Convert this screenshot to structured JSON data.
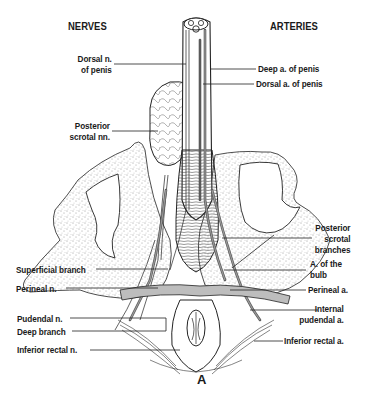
{
  "figure": {
    "panel_label": "A",
    "headings": {
      "left": "NERVES",
      "right": "ARTERIES"
    },
    "nerves": [
      {
        "id": "dorsal_n",
        "line1": "Dorsal n.",
        "line2": "of penis"
      },
      {
        "id": "post_scrotal_nn",
        "line1": "Posterior",
        "line2": "scrotal nn."
      },
      {
        "id": "superficial_branch",
        "line1": "Superficial branch"
      },
      {
        "id": "perineal_n",
        "line1": "Perineal n."
      },
      {
        "id": "pudendal_n",
        "line1": "Pudendal n."
      },
      {
        "id": "deep_branch",
        "line1": "Deep branch"
      },
      {
        "id": "inferior_rectal_n",
        "line1": "Inferior rectal n."
      }
    ],
    "arteries": [
      {
        "id": "deep_a",
        "line1": "Deep a. of penis"
      },
      {
        "id": "dorsal_a",
        "line1": "Dorsal a. of penis"
      },
      {
        "id": "post_scrotal_branches",
        "line1": "Posterior",
        "line2": "scrotal",
        "line3": "branches"
      },
      {
        "id": "a_bulb",
        "line1": "A. of the",
        "line2": "bulb"
      },
      {
        "id": "perineal_a",
        "line1": "Perineal a."
      },
      {
        "id": "internal_pudendal_a",
        "line1": "Internal",
        "line2": "pudendal a."
      },
      {
        "id": "inferior_rectal_a",
        "line1": "Inferior rectal a."
      }
    ],
    "colors": {
      "ink": "#1a1a1a",
      "vessel": "#6e6e6e",
      "paper": "#ffffff"
    }
  }
}
